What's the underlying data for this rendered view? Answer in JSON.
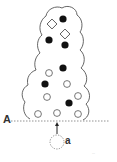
{
  "diagram": {
    "labels": {
      "line": "A",
      "particle": "a"
    },
    "watermark": "···",
    "colors": {
      "outline": "#555555",
      "filled": "#111111",
      "open": "#666666",
      "dashed": "#777777"
    },
    "elements": {
      "diamonds": [
        {
          "x": 52,
          "y": 24
        },
        {
          "x": 65,
          "y": 34
        }
      ],
      "filled_circles": [
        {
          "x": 63,
          "y": 19
        },
        {
          "x": 49,
          "y": 40
        },
        {
          "x": 65,
          "y": 45
        },
        {
          "x": 63,
          "y": 68
        },
        {
          "x": 45,
          "y": 84
        },
        {
          "x": 69,
          "y": 103
        }
      ],
      "open_circles": [
        {
          "x": 49,
          "y": 73
        },
        {
          "x": 67,
          "y": 84
        },
        {
          "x": 47,
          "y": 97
        },
        {
          "x": 78,
          "y": 96
        },
        {
          "x": 38,
          "y": 114
        },
        {
          "x": 57,
          "y": 113
        },
        {
          "x": 78,
          "y": 114
        }
      ],
      "dashed_line_y": 121,
      "particle": {
        "x": 57,
        "y": 142,
        "r": 7
      },
      "arrow": {
        "from_y": 134,
        "to_y": 123,
        "x": 57
      }
    }
  }
}
